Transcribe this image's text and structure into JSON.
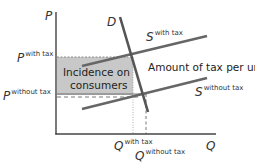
{
  "diagram": {
    "axes": {
      "y_label": "P",
      "x_label": "Q"
    },
    "curves": {
      "demand": {
        "label": "D"
      },
      "supply_with_tax": {
        "label": "S",
        "superscript": "with tax"
      },
      "supply_without_tax": {
        "label": "S",
        "superscript": "without tax"
      }
    },
    "price_levels": {
      "with_tax": {
        "label": "P",
        "superscript": "with tax"
      },
      "without_tax": {
        "label": "P",
        "superscript": "without tax"
      }
    },
    "quantity_levels": {
      "with_tax": {
        "label": "Q",
        "superscript": "with tax"
      },
      "without_tax": {
        "label": "Q",
        "superscript": "without tax"
      }
    },
    "shaded_region": {
      "line1": "Incidence on",
      "line2": "consumers",
      "fill": "#c8c8c8"
    },
    "annotation": "Amount of tax per unit",
    "colors": {
      "axis": "#444444",
      "curve": "#666666",
      "shade": "#c8c8c8"
    }
  }
}
